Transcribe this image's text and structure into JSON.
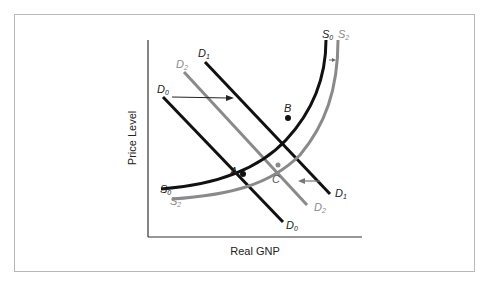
{
  "figure": {
    "x_axis_label": "Real GNP",
    "y_axis_label": "Price Level",
    "colors": {
      "black": "#111111",
      "gray": "#8a8a8a",
      "frame": "#b8b8b8"
    }
  },
  "curves": {
    "D0": {
      "label": "D",
      "sub": "0"
    },
    "D1": {
      "label": "D",
      "sub": "1"
    },
    "D2": {
      "label": "D",
      "sub": "2"
    },
    "S0": {
      "label": "S",
      "sub": "0"
    },
    "S2": {
      "label": "S",
      "sub": "2"
    }
  },
  "points": {
    "A": "A",
    "B": "B",
    "C": "C"
  }
}
